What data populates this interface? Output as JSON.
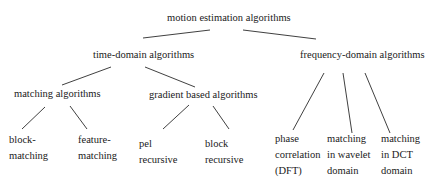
{
  "diagram": {
    "title": "motion estimation algorithms",
    "root": {
      "label": "motion estimation algorithms",
      "children": [
        {
          "label": "time-domain algorithms",
          "children": [
            {
              "label": "matching algorithms",
              "children": [
                {
                  "lines": [
                    "block-",
                    "matching"
                  ]
                },
                {
                  "lines": [
                    "feature-",
                    "matching"
                  ]
                }
              ]
            },
            {
              "label": "gradient based algorithms",
              "children": [
                {
                  "lines": [
                    "pel",
                    "recursive"
                  ]
                },
                {
                  "lines": [
                    "block",
                    "recursive"
                  ]
                }
              ]
            }
          ]
        },
        {
          "label": "frequency-domain algorithms",
          "children": [
            {
              "lines": [
                "phase",
                "correlation",
                "(DFT)"
              ]
            },
            {
              "lines": [
                "matching",
                "in wavelet",
                "domain"
              ]
            },
            {
              "lines": [
                "matching",
                "in DCT",
                "domain"
              ]
            }
          ]
        }
      ]
    },
    "edges": [
      {
        "from": "motion estimation algorithms",
        "to": "time-domain algorithms"
      },
      {
        "from": "motion estimation algorithms",
        "to": "frequency-domain algorithms"
      },
      {
        "from": "time-domain algorithms",
        "to": "matching algorithms"
      },
      {
        "from": "time-domain algorithms",
        "to": "gradient based algorithms"
      },
      {
        "from": "matching algorithms",
        "to": "block-matching"
      },
      {
        "from": "matching algorithms",
        "to": "feature-matching"
      },
      {
        "from": "gradient based algorithms",
        "to": "pel recursive"
      },
      {
        "from": "gradient based algorithms",
        "to": "block recursive"
      },
      {
        "from": "frequency-domain algorithms",
        "to": "phase correlation (DFT)"
      },
      {
        "from": "frequency-domain algorithms",
        "to": "matching in wavelet domain"
      },
      {
        "from": "frequency-domain algorithms",
        "to": "matching in DCT domain"
      }
    ],
    "colors": {
      "line": "#2a2a2a",
      "text": "#1a1a1a",
      "background": "#ffffff"
    }
  }
}
